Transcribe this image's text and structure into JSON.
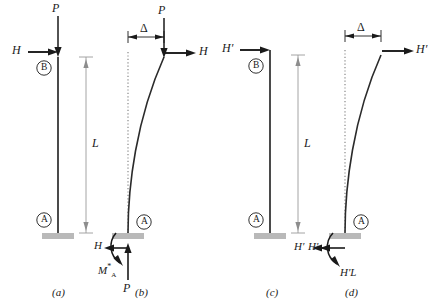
{
  "diagram": {
    "figures": [
      {
        "key": "a",
        "caption": "(a)",
        "loads": {
          "axial": "P",
          "lateral": "H"
        },
        "nodes": {
          "top": "B",
          "base": "A"
        },
        "dimension": "L",
        "shape": "straight",
        "deflection_label": null,
        "reactions": []
      },
      {
        "key": "b",
        "caption": "(b)",
        "loads": {
          "axial": "P",
          "lateral": "H"
        },
        "nodes": {
          "top": "",
          "base": "A"
        },
        "dimension": null,
        "shape": "deflected",
        "deflection_label": "Δ",
        "reactions": [
          {
            "name": "base-shear",
            "label": "H"
          },
          {
            "name": "base-moment",
            "label": "M*A"
          },
          {
            "name": "base-axial",
            "label": "P"
          }
        ]
      },
      {
        "key": "c",
        "caption": "(c)",
        "loads": {
          "axial": null,
          "lateral": "H′"
        },
        "nodes": {
          "top": "B",
          "base": "A"
        },
        "dimension": "L",
        "shape": "straight",
        "deflection_label": null,
        "reactions": [
          {
            "name": "base-shear",
            "label": "H′"
          }
        ]
      },
      {
        "key": "d",
        "caption": "(d)",
        "loads": {
          "axial": null,
          "lateral": "H′"
        },
        "nodes": {
          "top": "",
          "base": "A"
        },
        "dimension": null,
        "shape": "deflected",
        "deflection_label": "Δ",
        "reactions": [
          {
            "name": "base-shear",
            "label": "H′"
          },
          {
            "name": "base-moment",
            "label": "H′L"
          }
        ]
      }
    ],
    "colors": {
      "ink": "#1a1a1a",
      "member": "#2b2b2b",
      "dimension": "#9a9a9a",
      "support": "#b9b9b9",
      "reference": "#7d7d7d"
    }
  }
}
